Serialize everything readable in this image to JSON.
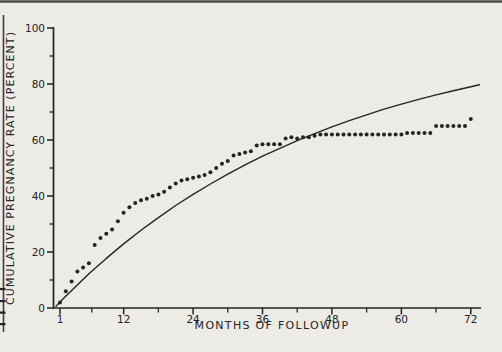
{
  "page": {
    "background_color": "#edebe6",
    "ink_color": "#242424",
    "artifacts": {
      "top_rule": {
        "color": "#4a4a4a"
      },
      "left_rule": {
        "color": "#3e3e3e"
      },
      "left_margin_dashes_y": [
        288,
        300,
        311.5,
        323
      ]
    }
  },
  "chart_data": {
    "type": "scatter",
    "title": "",
    "xlabel": "MONTHS OF FOLLOWUP",
    "ylabel": "CUMULATIVE PREGNANCY RATE (PERCENT)",
    "xlim": [
      1,
      73.5
    ],
    "ylim": [
      0,
      100
    ],
    "grid": false,
    "legend": "none",
    "x_ticks_major": [
      1,
      12,
      24,
      36,
      48,
      60,
      72
    ],
    "x_ticks_minor": [
      6.5,
      18,
      30,
      42,
      54,
      66
    ],
    "y_ticks_major": [
      0,
      20,
      40,
      60,
      80,
      100
    ],
    "y_ticks_minor": [
      10,
      30,
      50,
      70,
      90
    ],
    "series": [
      {
        "name": "observed-cumulative-pregnancy-rate",
        "type": "scatter",
        "marker": "filled-circle",
        "points": [
          [
            1,
            2
          ],
          [
            2,
            6
          ],
          [
            3,
            9.5
          ],
          [
            4,
            13
          ],
          [
            5,
            14.5
          ],
          [
            6,
            16
          ],
          [
            7,
            22.5
          ],
          [
            8,
            25
          ],
          [
            9,
            26.5
          ],
          [
            10,
            28
          ],
          [
            11,
            31
          ],
          [
            12,
            34
          ],
          [
            13,
            36
          ],
          [
            14,
            37.5
          ],
          [
            15,
            38.5
          ],
          [
            16,
            39
          ],
          [
            17,
            40
          ],
          [
            18,
            40.5
          ],
          [
            19,
            41.5
          ],
          [
            20,
            43
          ],
          [
            21,
            44.5
          ],
          [
            22,
            45.5
          ],
          [
            23,
            46
          ],
          [
            24,
            46.5
          ],
          [
            25,
            47
          ],
          [
            26,
            47.5
          ],
          [
            27,
            48.5
          ],
          [
            28,
            50
          ],
          [
            29,
            51.5
          ],
          [
            30,
            52.5
          ],
          [
            31,
            54.5
          ],
          [
            32,
            55
          ],
          [
            33,
            55.5
          ],
          [
            34,
            56
          ],
          [
            35,
            58
          ],
          [
            36,
            58.5
          ],
          [
            37,
            58.5
          ],
          [
            38,
            58.5
          ],
          [
            39,
            58.5
          ],
          [
            40,
            60.5
          ],
          [
            41,
            61
          ],
          [
            42,
            60.5
          ],
          [
            43,
            61
          ],
          [
            44,
            61
          ],
          [
            45,
            61.5
          ],
          [
            46,
            62
          ],
          [
            47,
            62
          ],
          [
            48,
            62
          ],
          [
            49,
            62
          ],
          [
            50,
            62
          ],
          [
            51,
            62
          ],
          [
            52,
            62
          ],
          [
            53,
            62
          ],
          [
            54,
            62
          ],
          [
            55,
            62
          ],
          [
            56,
            62
          ],
          [
            57,
            62
          ],
          [
            58,
            62
          ],
          [
            59,
            62
          ],
          [
            60,
            62
          ],
          [
            61,
            62.5
          ],
          [
            62,
            62.5
          ],
          [
            63,
            62.5
          ],
          [
            64,
            62.5
          ],
          [
            65,
            62.5
          ],
          [
            66,
            65
          ],
          [
            67,
            65
          ],
          [
            68,
            65
          ],
          [
            69,
            65
          ],
          [
            70,
            65
          ],
          [
            71,
            65
          ],
          [
            72,
            67.5
          ]
        ]
      },
      {
        "name": "fitted-expected-curve",
        "type": "line",
        "model": "rate = 100 * (1 - exp(-0.0217 * months))",
        "points": [
          [
            0.3,
            0.6
          ],
          [
            1.5,
            3.2
          ],
          [
            3,
            6.3
          ],
          [
            6,
            12.2
          ],
          [
            9,
            17.7
          ],
          [
            12,
            22.9
          ],
          [
            15,
            27.8
          ],
          [
            18,
            32.3
          ],
          [
            21,
            36.6
          ],
          [
            24,
            40.6
          ],
          [
            27,
            44.3
          ],
          [
            30,
            47.8
          ],
          [
            33,
            51.1
          ],
          [
            36,
            54.2
          ],
          [
            39,
            57.0
          ],
          [
            42,
            59.8
          ],
          [
            45,
            62.3
          ],
          [
            48,
            64.7
          ],
          [
            51,
            66.9
          ],
          [
            54,
            69.0
          ],
          [
            57,
            71.0
          ],
          [
            60,
            72.8
          ],
          [
            63,
            74.5
          ],
          [
            66,
            76.1
          ],
          [
            69,
            77.6
          ],
          [
            72,
            79.0
          ],
          [
            73.5,
            79.7
          ]
        ]
      }
    ]
  }
}
